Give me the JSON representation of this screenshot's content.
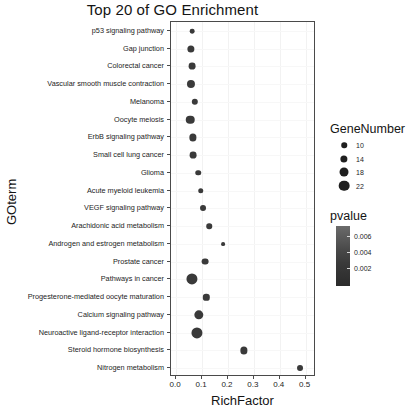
{
  "chart_data": {
    "type": "scatter",
    "title": "Top 20 of GO Enrichment",
    "xlabel": "RichFactor",
    "ylabel": "GOterm",
    "xlim": [
      -0.02,
      0.54
    ],
    "xticks": [
      0.0,
      0.1,
      0.2,
      0.3,
      0.4,
      0.5
    ],
    "xtick_labels": [
      "0.0",
      "0.1",
      "0.2",
      "0.3",
      "0.4",
      "0.5"
    ],
    "grid": true,
    "legend_position": "right",
    "categories": [
      "p53 signaling pathway",
      "Gap junction",
      "Colorectal cancer",
      "Vascular smooth muscle contraction",
      "Melanoma",
      "Oocyte meiosis",
      "ErbB signaling pathway",
      "Small cell lung cancer",
      "Glioma",
      "Acute myeloid leukemia",
      "VEGF signaling pathway",
      "Arachidonic acid metabolism",
      "Androgen and estrogen metabolism",
      "Prostate cancer",
      "Pathways in cancer",
      "Progesterone-mediated oocyte maturation",
      "Calcium signaling pathway",
      "Neuroactive ligand-receptor interaction",
      "Steroid hormone biosynthesis",
      "Nitrogen metabolism"
    ],
    "points": [
      {
        "term": "p53 signaling pathway",
        "richfactor": 0.062,
        "genenumber": 8,
        "pvalue": 0.0065
      },
      {
        "term": "Gap junction",
        "richfactor": 0.057,
        "genenumber": 14,
        "pvalue": 0.0062
      },
      {
        "term": "Colorectal cancer",
        "richfactor": 0.06,
        "genenumber": 13,
        "pvalue": 0.0058
      },
      {
        "term": "Vascular smooth muscle contraction",
        "richfactor": 0.057,
        "genenumber": 16,
        "pvalue": 0.0055
      },
      {
        "term": "Melanoma",
        "richfactor": 0.073,
        "genenumber": 12,
        "pvalue": 0.005
      },
      {
        "term": "Oocyte meiosis",
        "richfactor": 0.055,
        "genenumber": 17,
        "pvalue": 0.0046
      },
      {
        "term": "ErbB signaling pathway",
        "richfactor": 0.064,
        "genenumber": 14,
        "pvalue": 0.0042
      },
      {
        "term": "Small cell lung cancer",
        "richfactor": 0.066,
        "genenumber": 13,
        "pvalue": 0.0038
      },
      {
        "term": "Glioma",
        "richfactor": 0.086,
        "genenumber": 10,
        "pvalue": 0.0034
      },
      {
        "term": "Acute myeloid leukemia",
        "richfactor": 0.095,
        "genenumber": 10,
        "pvalue": 0.003
      },
      {
        "term": "VEGF signaling pathway",
        "richfactor": 0.105,
        "genenumber": 11,
        "pvalue": 0.0027
      },
      {
        "term": "Arachidonic acid metabolism",
        "richfactor": 0.128,
        "genenumber": 10,
        "pvalue": 0.0024
      },
      {
        "term": "Androgen and estrogen metabolism",
        "richfactor": 0.18,
        "genenumber": 6,
        "pvalue": 0.0021
      },
      {
        "term": "Prostate cancer",
        "richfactor": 0.113,
        "genenumber": 13,
        "pvalue": 0.0018
      },
      {
        "term": "Pathways in cancer",
        "richfactor": 0.062,
        "genenumber": 23,
        "pvalue": 0.0015
      },
      {
        "term": "Progesterone-mediated oocyte maturation",
        "richfactor": 0.117,
        "genenumber": 12,
        "pvalue": 0.0013
      },
      {
        "term": "Calcium signaling pathway",
        "richfactor": 0.087,
        "genenumber": 19,
        "pvalue": 0.0011
      },
      {
        "term": "Neuroactive ligand-receptor interaction",
        "richfactor": 0.08,
        "genenumber": 23,
        "pvalue": 0.0009
      },
      {
        "term": "Steroid hormone biosynthesis",
        "richfactor": 0.262,
        "genenumber": 14,
        "pvalue": 0.0006
      },
      {
        "term": "Nitrogen metabolism",
        "richfactor": 0.478,
        "genenumber": 11,
        "pvalue": 0.0003
      }
    ],
    "size_legend": {
      "title": "GeneNumber",
      "values": [
        10,
        14,
        18,
        22
      ],
      "labels": [
        "10",
        "14",
        "18",
        "22"
      ]
    },
    "color_legend": {
      "title": "pvalue",
      "tick_values": [
        0.006,
        0.004,
        0.002
      ],
      "tick_labels": [
        "0.006",
        "0.004",
        "0.002"
      ],
      "high_color": "#6b6b6b",
      "low_color": "#2b2b2b"
    }
  }
}
